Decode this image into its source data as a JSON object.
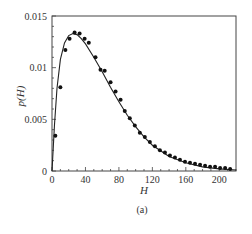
{
  "chart_data": {
    "type": "scatter",
    "title": "",
    "caption": "(a)",
    "xlabel": "H",
    "ylabel": "p(H)",
    "xlim": [
      0,
      220
    ],
    "ylim": [
      0,
      0.015
    ],
    "xticks": [
      0,
      40,
      80,
      120,
      160,
      200
    ],
    "xtick_labels": [
      "0",
      "40",
      "80",
      "120",
      "160",
      "200"
    ],
    "yticks": [
      0,
      0.005,
      0.01,
      0.015
    ],
    "ytick_labels": [
      "0",
      "0.005",
      "0.01",
      "0.015"
    ],
    "grid": false,
    "legend": null,
    "series": [
      {
        "name": "data",
        "style": "markers",
        "x": [
          4,
          10,
          16,
          21,
          27,
          33,
          39,
          44,
          52,
          58,
          63,
          70,
          76,
          82,
          87,
          93,
          99,
          105,
          111,
          117,
          123,
          129,
          135,
          141,
          147,
          153,
          159,
          165,
          171,
          177,
          183,
          189,
          195,
          201,
          207,
          213
        ],
        "y": [
          0.0034,
          0.0081,
          0.0117,
          0.0128,
          0.0134,
          0.0133,
          0.0128,
          0.0124,
          0.011,
          0.0098,
          0.0097,
          0.0086,
          0.0077,
          0.0069,
          0.0058,
          0.0051,
          0.0044,
          0.0037,
          0.0033,
          0.0028,
          0.0024,
          0.002,
          0.0018,
          0.0015,
          0.0013,
          0.0011,
          0.0009,
          0.0008,
          0.0007,
          0.0006,
          0.0005,
          0.0004,
          0.0004,
          0.0003,
          0.0003,
          0.0002
        ]
      },
      {
        "name": "fit",
        "style": "line",
        "x": [
          0,
          3,
          6,
          10,
          15,
          20,
          25,
          30,
          35,
          40,
          50,
          60,
          70,
          80,
          90,
          100,
          110,
          120,
          140,
          160,
          180,
          200,
          220
        ],
        "y": [
          0,
          0.0045,
          0.008,
          0.0108,
          0.0124,
          0.0131,
          0.0133,
          0.0132,
          0.0128,
          0.0123,
          0.011,
          0.0096,
          0.0081,
          0.0067,
          0.0054,
          0.0043,
          0.0033,
          0.0025,
          0.0014,
          0.0008,
          0.0004,
          0.0002,
          0.0001
        ]
      }
    ]
  }
}
